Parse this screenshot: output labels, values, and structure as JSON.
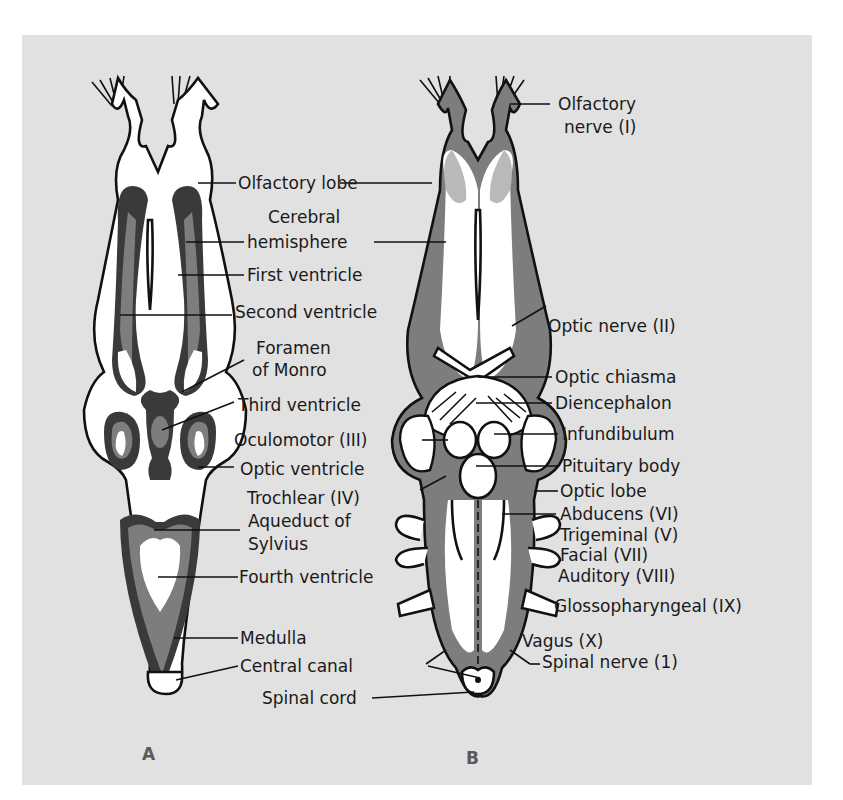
{
  "figure": {
    "panel_background": "#e1e1e1",
    "panels": [
      {
        "id": "A",
        "caption": "A",
        "view": "horizontal section of frog brain",
        "labels": [
          {
            "id": "olfactory-lobe",
            "text": "Olfactory lobe"
          },
          {
            "id": "cerebral-hemisphere-1",
            "text": "Cerebral"
          },
          {
            "id": "cerebral-hemisphere-2",
            "text": "hemisphere"
          },
          {
            "id": "first-ventricle",
            "text": "First ventricle"
          },
          {
            "id": "second-ventricle",
            "text": "Second ventricle"
          },
          {
            "id": "foramen-of-monro-1",
            "text": "Foramen"
          },
          {
            "id": "foramen-of-monro-2",
            "text": "of Monro"
          },
          {
            "id": "third-ventricle",
            "text": "Third ventricle"
          },
          {
            "id": "optic-ventricle",
            "text": "Optic ventricle"
          },
          {
            "id": "aqueduct-of-sylvius-1",
            "text": "Aqueduct of"
          },
          {
            "id": "aqueduct-of-sylvius-2",
            "text": "Sylvius"
          },
          {
            "id": "fourth-ventricle",
            "text": "Fourth ventricle"
          },
          {
            "id": "medulla",
            "text": "Medulla"
          },
          {
            "id": "central-canal",
            "text": "Central canal"
          }
        ]
      },
      {
        "id": "B",
        "caption": "B",
        "view": "ventral view of frog brain",
        "labels": [
          {
            "id": "olfactory-nerve-1",
            "text": "Olfactory"
          },
          {
            "id": "olfactory-nerve-2",
            "text": "nerve (I)"
          },
          {
            "id": "optic-nerve",
            "text": "Optic nerve (II)"
          },
          {
            "id": "optic-chiasma",
            "text": "Optic chiasma"
          },
          {
            "id": "diencephalon",
            "text": "Diencephalon"
          },
          {
            "id": "oculomotor",
            "text": "Oculomotor (III)"
          },
          {
            "id": "infundibulum",
            "text": "Infundibulum"
          },
          {
            "id": "pituitary-body",
            "text": "Pituitary body"
          },
          {
            "id": "trochlear",
            "text": "Trochlear (IV)"
          },
          {
            "id": "optic-lobe",
            "text": "Optic lobe"
          },
          {
            "id": "abducens",
            "text": "Abducens (VI)"
          },
          {
            "id": "trigeminal",
            "text": "Trigeminal (V)"
          },
          {
            "id": "facial",
            "text": "Facial (VII)"
          },
          {
            "id": "auditory",
            "text": "Auditory (VIII)"
          },
          {
            "id": "glossopharyngeal",
            "text": "Glossopharyngeal (IX)"
          },
          {
            "id": "vagus",
            "text": "Vagus (X)"
          },
          {
            "id": "spinal-nerve",
            "text": "Spinal nerve (1)"
          },
          {
            "id": "spinal-cord",
            "text": "Spinal cord"
          }
        ]
      }
    ]
  }
}
